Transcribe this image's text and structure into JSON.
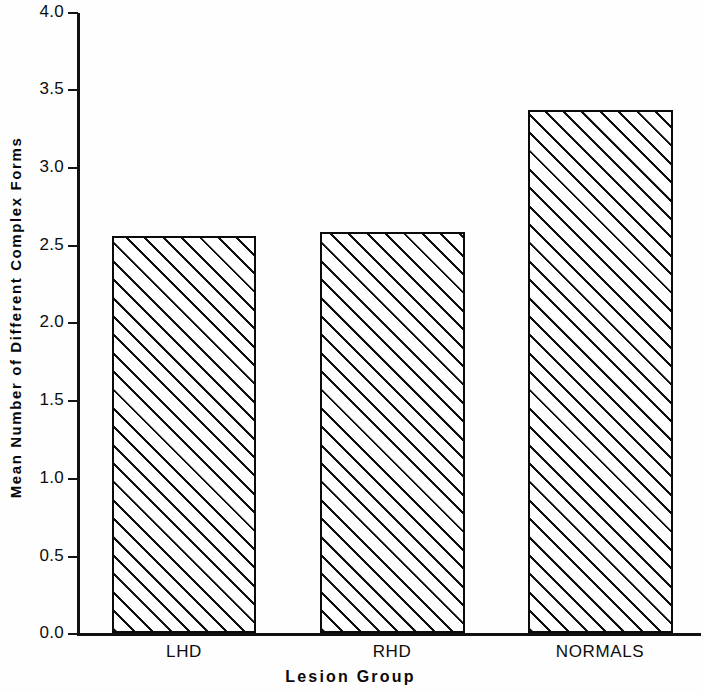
{
  "chart_data": {
    "type": "bar",
    "title": "",
    "subtitle": "",
    "categories": [
      "LHD",
      "RHD",
      "NORMALS"
    ],
    "values": [
      2.56,
      2.58,
      3.37
    ],
    "xlabel": "Lesion Group",
    "ylabel": "Mean Number of Different Complex Forms",
    "ylim": [
      0.0,
      4.0
    ],
    "xlim": null,
    "yticks": [
      "0.0",
      "0.5",
      "1.0",
      "1.5",
      "2.0",
      "2.5",
      "3.0",
      "3.5",
      "4.0"
    ],
    "ytick_values": [
      0.0,
      0.5,
      1.0,
      1.5,
      2.0,
      2.5,
      3.0,
      3.5,
      4.0
    ],
    "grid": false,
    "legend": null,
    "legend_position": "none",
    "annotations": [],
    "bar_fill": "diagonal-hatch",
    "bar_edge_color": "#0a0a0a",
    "bar_face_color": "#ffffff",
    "hatch_color": "#101010",
    "background_color": "#fefefe",
    "axis_color": "#111111"
  },
  "axes": {
    "y_title": "Mean Number of Different Complex Forms",
    "x_title": "Lesion Group"
  }
}
